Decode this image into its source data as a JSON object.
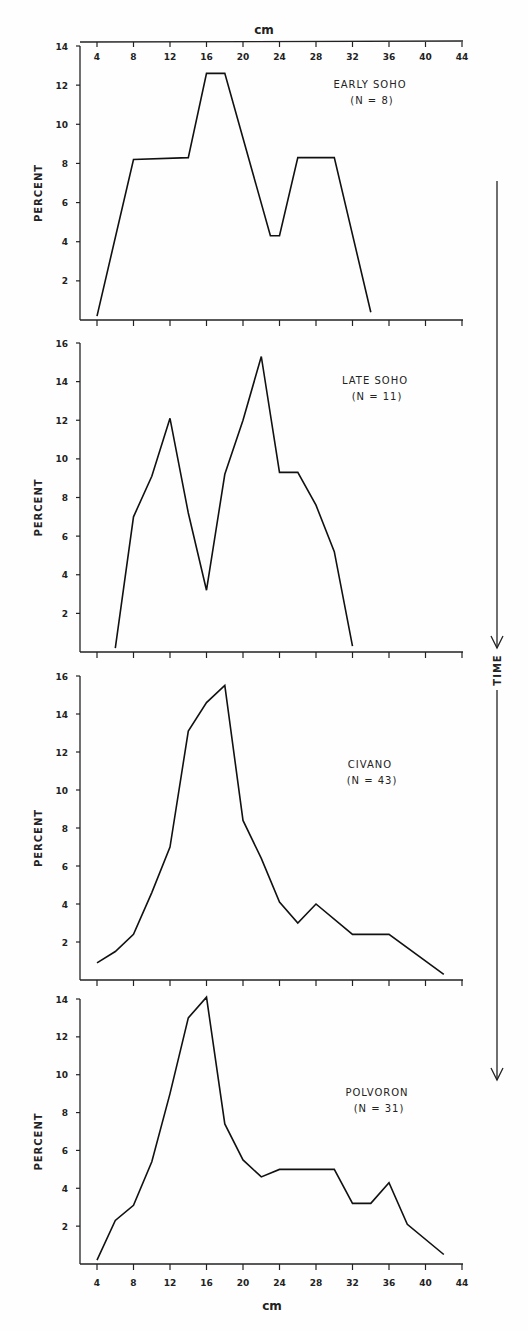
{
  "figure": {
    "x_axis_label": "cm",
    "y_axis_label": "PERCENT",
    "time_label": "TIME",
    "x_ticks": [
      4,
      8,
      12,
      16,
      20,
      24,
      28,
      32,
      36,
      40,
      44
    ]
  },
  "chart_data": [
    {
      "type": "line",
      "title": "EARLY SOHO",
      "subtitle": "(N=8)",
      "xlabel": "cm",
      "ylabel": "PERCENT",
      "yticks": [
        2,
        4,
        6,
        8,
        10,
        12,
        14
      ],
      "ylim": [
        0,
        14
      ],
      "xlim": [
        2.5,
        44
      ],
      "grid": false,
      "x": [
        4,
        8,
        14,
        16,
        18,
        23,
        24,
        26,
        30,
        34
      ],
      "values": [
        0.2,
        8.2,
        8.3,
        12.6,
        12.6,
        4.3,
        4.3,
        8.3,
        8.3,
        0.4
      ]
    },
    {
      "type": "line",
      "title": "LATE SOHO",
      "subtitle": "(N=11)",
      "xlabel": "cm",
      "ylabel": "PERCENT",
      "yticks": [
        2,
        4,
        6,
        8,
        10,
        12,
        14,
        16
      ],
      "ylim": [
        0,
        16
      ],
      "xlim": [
        2.5,
        44
      ],
      "grid": false,
      "x": [
        6,
        8,
        10,
        12,
        14,
        16,
        18,
        20,
        22,
        24,
        26,
        28,
        30,
        32
      ],
      "values": [
        0.2,
        7.0,
        9.1,
        12.1,
        7.2,
        3.2,
        9.2,
        12.0,
        15.3,
        9.3,
        9.3,
        7.6,
        5.2,
        0.3
      ]
    },
    {
      "type": "line",
      "title": "CIVANO",
      "subtitle": "(N=43)",
      "xlabel": "cm",
      "ylabel": "PERCENT",
      "yticks": [
        2,
        4,
        6,
        8,
        10,
        12,
        14,
        16
      ],
      "ylim": [
        0,
        16
      ],
      "xlim": [
        2.5,
        44
      ],
      "grid": false,
      "x": [
        4,
        6,
        8,
        10,
        12,
        14,
        16,
        18,
        20,
        22,
        24,
        26,
        28,
        32,
        36,
        42
      ],
      "values": [
        0.9,
        1.5,
        2.4,
        4.6,
        7.0,
        13.1,
        14.6,
        15.5,
        8.4,
        6.4,
        4.1,
        3.0,
        4.0,
        2.4,
        2.4,
        0.3
      ]
    },
    {
      "type": "line",
      "title": "POLVORON",
      "subtitle": "(N=31)",
      "xlabel": "cm",
      "ylabel": "PERCENT",
      "yticks": [
        2,
        4,
        6,
        8,
        10,
        12,
        14
      ],
      "ylim": [
        0,
        14
      ],
      "xlim": [
        2.5,
        44
      ],
      "grid": false,
      "x": [
        4,
        6,
        8,
        10,
        12,
        14,
        16,
        18,
        20,
        22,
        24,
        30,
        32,
        34,
        36,
        38,
        42
      ],
      "values": [
        0.2,
        2.3,
        3.1,
        5.4,
        9.0,
        13.0,
        14.1,
        7.4,
        5.5,
        4.6,
        5.0,
        5.0,
        3.2,
        3.2,
        4.3,
        2.1,
        0.5
      ]
    }
  ]
}
